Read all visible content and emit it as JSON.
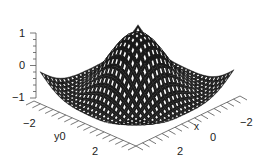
{
  "chart_data": {
    "type": "surface3d",
    "title": "",
    "function_hint": "z = cos(r)-like radial wave; central peak ~1, ring trough ~-1",
    "xlabel": "x",
    "ylabel": "y",
    "zlabel": "",
    "x_ticks": [
      "-2",
      "0",
      "2"
    ],
    "y_ticks": [
      "-2",
      "0",
      "2"
    ],
    "z_ticks": [
      "-1",
      "0",
      "1"
    ],
    "xlim": [
      -3,
      3
    ],
    "ylim": [
      -3,
      3
    ],
    "zlim": [
      -1,
      1
    ],
    "grid_size": 24,
    "surface_color": "#1a1a1a",
    "mesh_color": "#ffffff",
    "features": {
      "peak": {
        "x": 0,
        "y": 0,
        "z": 1
      },
      "trough_ring_z": -0.6,
      "corner_z": 0
    }
  },
  "labels": {
    "z_top": "1",
    "z_mid": "0",
    "z_bot": "−1",
    "y_neg": "−2",
    "y_mid": "y0",
    "y_pos": "2",
    "x_pos": "2",
    "x_mid": "0",
    "x_neg": "−2",
    "x_name": "x"
  }
}
